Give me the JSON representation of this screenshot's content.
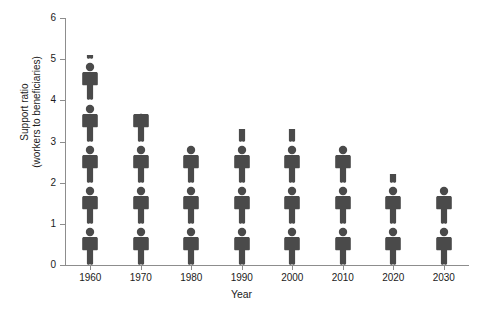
{
  "chart_data": {
    "type": "bar",
    "subtype": "pictograph",
    "title": "",
    "xlabel": "Year",
    "ylabel": "Support ratio\n(workers to beneficiaries)",
    "ylabel_line1": "Support ratio",
    "ylabel_line2": "(workers to beneficiaries)",
    "categories": [
      "1960",
      "1970",
      "1980",
      "1990",
      "2000",
      "2010",
      "2020",
      "2030"
    ],
    "values": [
      5.1,
      3.7,
      3.0,
      3.3,
      3.3,
      3.0,
      2.2,
      2.0
    ],
    "ylim": [
      0,
      6
    ],
    "yticks": [
      0,
      1,
      2,
      3,
      4,
      5,
      6
    ],
    "ytick_labels": [
      "0",
      "1",
      "2",
      "3",
      "4",
      "5",
      "6"
    ],
    "grid": false,
    "legend": false,
    "icon": "person-figure",
    "icon_unit_value": 1,
    "series": [
      {
        "name": "Support ratio",
        "values": [
          5.1,
          3.7,
          3.0,
          3.3,
          3.3,
          3.0,
          2.2,
          2.0
        ]
      }
    ],
    "colors": {
      "figure": "#4a4a4a",
      "axis": "#8d8d8d",
      "text": "#1b1b1b",
      "background": "#ffffff"
    }
  }
}
